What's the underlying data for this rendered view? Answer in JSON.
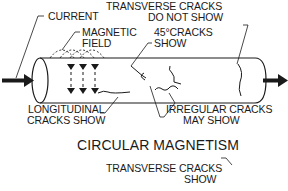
{
  "figure": {
    "top_diagram": {
      "title": "CIRCULAR MAGNETISM",
      "labels": {
        "current": "CURRENT",
        "magnetic_field_line1": "MAGNETIC",
        "magnetic_field_line2": "FIELD",
        "transverse_line1": "TRANSVERSE CRACKS",
        "transverse_line2": "DO NOT SHOW",
        "cracks45_line1": "45°CRACKS",
        "cracks45_line2": "SHOW",
        "longitudinal_line1": "LONGITUDINAL",
        "longitudinal_line2": "CRACKS SHOW",
        "irregular_line1": "IRREGULAR CRACKS",
        "irregular_line2": "MAY SHOW"
      }
    },
    "bottom_diagram": {
      "labels": {
        "transverse_line1": "TRANSVERSE CRACKS",
        "transverse_line2": "SHOW"
      }
    },
    "colors": {
      "ink": "#1a1a1a",
      "background": "#ffffff"
    }
  }
}
